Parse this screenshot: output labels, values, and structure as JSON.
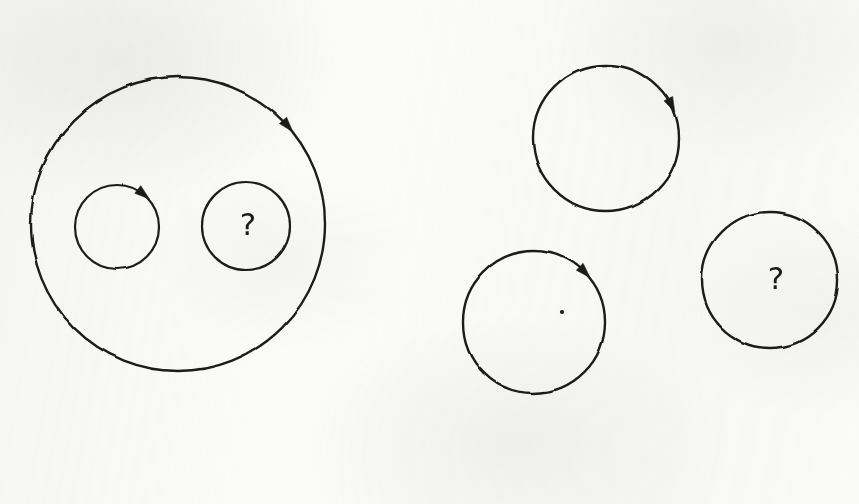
{
  "figure": {
    "medium": "pencil-on-paper scan",
    "background_color": "#fbfbfa",
    "ink_color": "#1b1b1b",
    "width": 859,
    "height": 504
  },
  "divider": {
    "name": "vertical-dashed-divider",
    "orientation": "vertical",
    "x": 398,
    "y_start": 27,
    "y_end": 480,
    "dash_length": 25,
    "gap_length": 14,
    "stroke_width": 3,
    "color": "#1b1b1b"
  },
  "labels": {
    "question_mark": "?"
  },
  "chart_data": {
    "type": "diagram",
    "panels": [
      {
        "id": "left-panel",
        "name": "nested-configuration",
        "description": "One large circle containing two smaller circles",
        "shapes": [
          {
            "id": "outer-circle",
            "role": "outer-boundary-circle",
            "cx": 178,
            "cy": 224,
            "r": 147,
            "stroke_width": 2.4,
            "arrow": {
              "angle_deg": -42,
              "direction": "clockwise"
            },
            "label": null,
            "center_dot": false
          },
          {
            "id": "inner-circle-left",
            "role": "inner-circle-with-arrow",
            "cx": 117,
            "cy": 227,
            "r": 42,
            "stroke_width": 2.2,
            "arrow": {
              "angle_deg": -52,
              "direction": "clockwise"
            },
            "label": null,
            "center_dot": false
          },
          {
            "id": "inner-circle-right",
            "role": "inner-circle-with-question-mark",
            "cx": 246,
            "cy": 226,
            "r": 44,
            "stroke_width": 2.2,
            "arrow": null,
            "label": "?",
            "label_size": 31,
            "label_dx": 2,
            "label_dy": -2,
            "center_dot": false
          }
        ]
      },
      {
        "id": "right-panel",
        "name": "separate-configuration",
        "description": "Three separate non-overlapping circles",
        "shapes": [
          {
            "id": "top-circle",
            "role": "circle-with-arrow",
            "cx": 606,
            "cy": 138,
            "r": 73,
            "stroke_width": 2.4,
            "arrow": {
              "angle_deg": -27,
              "direction": "clockwise"
            },
            "label": null,
            "center_dot": false
          },
          {
            "id": "bottom-left-circle",
            "role": "circle-with-arrow-and-center-dot",
            "cx": 534,
            "cy": 322,
            "r": 71,
            "stroke_width": 2.4,
            "arrow": {
              "angle_deg": -45,
              "direction": "clockwise"
            },
            "label": null,
            "center_dot": true,
            "dot_cx": 562,
            "dot_cy": 312
          },
          {
            "id": "right-circle",
            "role": "circle-with-question-mark",
            "cx": 770,
            "cy": 280,
            "r": 68,
            "stroke_width": 2.4,
            "arrow": null,
            "label": "?",
            "label_size": 31,
            "label_dx": 6,
            "label_dy": -2,
            "center_dot": false
          }
        ]
      }
    ]
  }
}
